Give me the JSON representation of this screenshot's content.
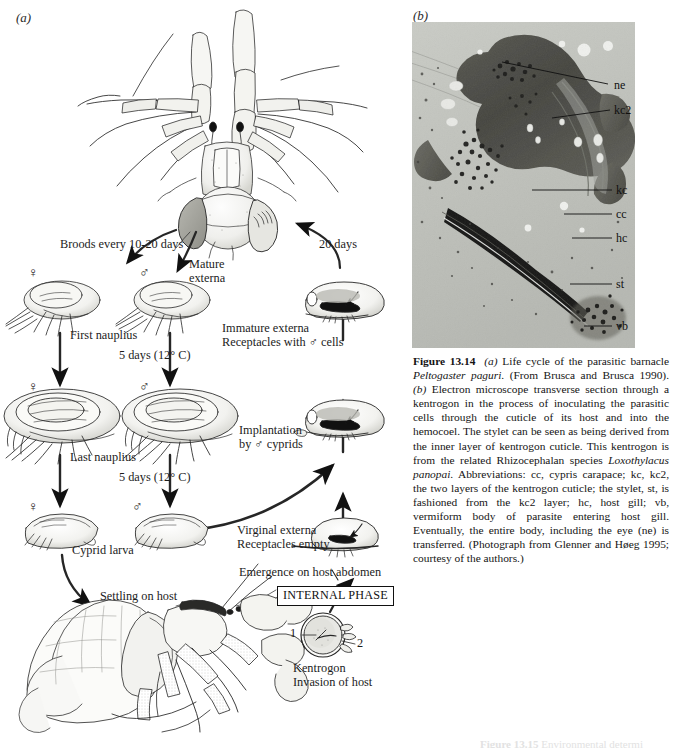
{
  "figure": {
    "panel_a_letter": "(a)",
    "panel_b_letter": "(b)"
  },
  "lifecycle": {
    "labels": {
      "broods": "Broods every 10-20 days",
      "twenty_days": "20 days",
      "mature_externa": "Mature\nexterna",
      "female_symbol_1": "♀",
      "male_symbol_1": "♂",
      "first_nauplius": "First nauplius",
      "five_days_1": "5 days (12° C)",
      "female_symbol_2": "♀",
      "male_symbol_2": "♂",
      "last_nauplius": "Last nauplius",
      "five_days_2": "5 days (12° C)",
      "female_symbol_3": "♀",
      "male_symbol_3": "♂",
      "cyprid_larva": "Cyprid larva",
      "immature_externa": "Immature externa\nReceptacles with ♂ cells",
      "implantation": "Implantation\nby ♂ cyprids",
      "virginal_externa": "Virginal externa\nReceptacles empty",
      "emergence": "Emergence on host abdomen",
      "internal_phase": "INTERNAL PHASE",
      "settling_on_host": "Settling on host",
      "kentrogon": "Kentrogon\nInvasion of host",
      "kentrogon_num_1": "1",
      "kentrogon_num_2": "2"
    }
  },
  "micrograph": {
    "labels": [
      {
        "name": "ne",
        "text": "ne"
      },
      {
        "name": "kc2",
        "text": "kc2"
      },
      {
        "name": "kc",
        "text": "kc"
      },
      {
        "name": "cc",
        "text": "cc"
      },
      {
        "name": "hc",
        "text": "hc"
      },
      {
        "name": "st",
        "text": "st"
      },
      {
        "name": "vb",
        "text": "vb"
      }
    ]
  },
  "caption": {
    "figure_number": "Figure 13.14",
    "part_a_marker": "(a)",
    "text_1": " Life cycle of the parasitic barnacle ",
    "species_1": "Peltogaster paguri",
    "text_2": ". (From Brusca and Brusca 1990). ",
    "part_b_marker": "(b)",
    "text_3": " Electron microscope transverse section through a kentrogon in the process of inoculating the parasitic cells through the cuticle of its host and into the hemocoel. The stylet can be seen as being derived from the inner layer of kentrogon cuticle. This kentrogon is from the related Rhizocephalan species ",
    "species_2": "Loxothylacus panopai",
    "text_4": ". Abbreviations: cc, cypris carapace; kc, kc2, the two layers of the kentrogon cuticle; the stylet, st, is fashioned from the kc2 layer; hc, host gill; vb, vermiform body of parasite entering host gill. Eventually, the entire body, including the eye (ne) is transferred. (Photograph from Glenner and Høeg 1995; courtesy of the authors.)"
  },
  "next_caption": {
    "figure_number": "Figure 13.15",
    "text": "  Environmental determi"
  },
  "colors": {
    "ink": "#1a1a1a",
    "page_background": "#ffffff",
    "micrograph_light": "#c4c6c0",
    "micrograph_dark": "#3a3a38",
    "shading": "#d9d9d5"
  }
}
